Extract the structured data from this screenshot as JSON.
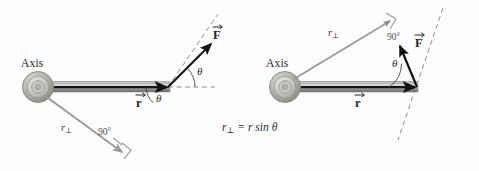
{
  "figure": {
    "caption": {
      "r_perp_symbol": "r",
      "perp_subscript": "⊥",
      "equals_expr": "= r sin",
      "theta_symbol": "θ",
      "full_text": "r⊥ = r sin θ"
    },
    "colors": {
      "rod_dark": "#3a3a3c",
      "rod_light": "#d8d8d6",
      "rod_mid": "#a9a9a6",
      "arrow_black": "#141416",
      "r_perp_gray": "#9a9a98",
      "dashed_gray": "#8e8e8c",
      "hub_outer": "#a3a3a0",
      "hub_inner": "#cfcfcc",
      "text": "#25262a",
      "background": "#fdfdfd"
    },
    "panels": [
      {
        "id": "left-panel",
        "name": "acute-angle-case",
        "axis_label": "Axis",
        "r_label": "r",
        "force_label": "F",
        "r_perp_label": "r",
        "r_perp_sub": "⊥",
        "angle_label": "θ",
        "angle_label_2": "θ",
        "right_angle_label": "90°"
      },
      {
        "id": "right-panel",
        "name": "obtuse-angle-case",
        "axis_label": "Axis",
        "r_label": "r",
        "force_label": "F",
        "r_perp_label": "r",
        "r_perp_sub": "⊥",
        "angle_label": "θ",
        "right_angle_label": "90°"
      }
    ]
  }
}
